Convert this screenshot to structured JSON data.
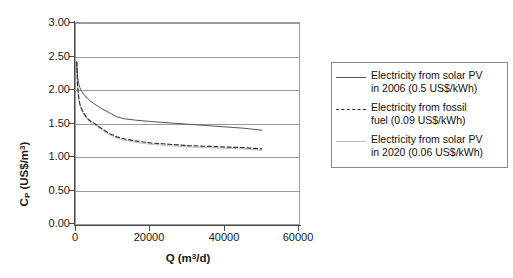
{
  "chart_data": {
    "type": "line",
    "title": "",
    "xlabel": "Q (m3/d)",
    "ylabel": "Cp (US$/m3)",
    "xlim": [
      0,
      60000
    ],
    "ylim": [
      0,
      3.0
    ],
    "grid": true,
    "legend_position": "right",
    "x_ticks": [
      "0",
      "20000",
      "40000",
      "60000"
    ],
    "x_tick_values": [
      0,
      20000,
      40000,
      60000
    ],
    "y_ticks": [
      "0.00",
      "0.50",
      "1.00",
      "1.50",
      "2.00",
      "2.50",
      "3.00"
    ],
    "y_tick_values": [
      0.0,
      0.5,
      1.0,
      1.5,
      2.0,
      2.5,
      3.0
    ],
    "series": [
      {
        "name": "Electricity from solar PV in 2006 (0.5 US$/kWh)",
        "style": "solid",
        "color": "#555555",
        "x": [
          200,
          400,
          700,
          1000,
          1500,
          2000,
          3000,
          4000,
          5000,
          7000,
          9000,
          11000,
          13000,
          16000,
          20000,
          25000,
          30000,
          35000,
          40000,
          45000,
          50000
        ],
        "y": [
          2.42,
          2.2,
          2.1,
          2.04,
          1.98,
          1.94,
          1.88,
          1.83,
          1.79,
          1.72,
          1.66,
          1.6,
          1.57,
          1.55,
          1.53,
          1.51,
          1.49,
          1.47,
          1.45,
          1.43,
          1.4
        ]
      },
      {
        "name": "Electricity from fossil fuel (0.09 US$/kWh)",
        "style": "dashed",
        "color": "#333333",
        "x": [
          200,
          400,
          700,
          1000,
          1500,
          2000,
          3000,
          4000,
          5000,
          7000,
          9000,
          11000,
          13000,
          16000,
          20000,
          25000,
          30000,
          35000,
          40000,
          45000,
          50000
        ],
        "y": [
          2.42,
          2.08,
          1.9,
          1.8,
          1.72,
          1.66,
          1.58,
          1.53,
          1.5,
          1.42,
          1.35,
          1.3,
          1.27,
          1.24,
          1.21,
          1.19,
          1.17,
          1.16,
          1.15,
          1.14,
          1.12
        ]
      },
      {
        "name": "Electricity from solar PV in 2020 (0.06 US$/kWh)",
        "style": "solid",
        "color": "#bfbfbf",
        "x": [
          200,
          400,
          700,
          1000,
          1500,
          2000,
          3000,
          4000,
          5000,
          7000,
          9000,
          11000,
          13000,
          16000,
          20000,
          25000,
          30000,
          35000,
          40000,
          45000,
          50000
        ],
        "y": [
          2.41,
          2.06,
          1.88,
          1.78,
          1.7,
          1.64,
          1.56,
          1.51,
          1.48,
          1.4,
          1.33,
          1.28,
          1.25,
          1.22,
          1.19,
          1.17,
          1.15,
          1.14,
          1.13,
          1.12,
          1.1
        ]
      }
    ]
  },
  "axes": {
    "y_title_main": "C",
    "y_title_sub": "P",
    "y_title_unit_pre": " (US$/m",
    "y_title_sup": "3",
    "y_title_post": ")",
    "x_title_main": "Q (m",
    "x_title_sup": "3",
    "x_title_post": "/d)"
  },
  "legend": {
    "items": [
      {
        "swatch": "solid-dark-line",
        "line1": "Electricity from solar PV",
        "line2": "in 2006 (0.5 US$/kWh)"
      },
      {
        "swatch": "dashed-line",
        "line1": "Electricity from fossil",
        "line2": "fuel (0.09 US$/kWh)"
      },
      {
        "swatch": "solid-light-line",
        "line1": "Electricity from solar PV",
        "line2": "in 2020 (0.06 US$/kWh)"
      }
    ]
  }
}
